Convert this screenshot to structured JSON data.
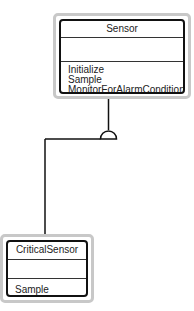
{
  "diagram": {
    "type": "UML class diagram",
    "classes": [
      {
        "name": "Sensor",
        "attributes": [],
        "operations": [
          "Initialize",
          "Sample",
          "MonitorForAlarmCondition"
        ]
      },
      {
        "name": "CriticalSensor",
        "attributes": [],
        "operations": [
          "Sample"
        ]
      }
    ],
    "relationships": [
      {
        "from": "CriticalSensor",
        "to": "Sensor",
        "kind": "inheritance"
      }
    ]
  },
  "colors": {
    "outer_border": "#c8c8c8",
    "inner_border": "#111111",
    "line": "#111111"
  }
}
